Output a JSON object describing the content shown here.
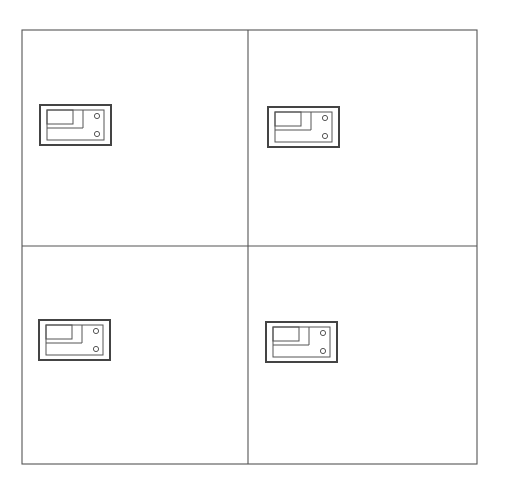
{
  "canvas": {
    "width": 505,
    "height": 487,
    "background": "#ffffff"
  },
  "colors": {
    "line": "#555555",
    "device_border": "#444444"
  },
  "frame": {
    "outer": {
      "x": 22,
      "y": 30,
      "width": 455,
      "height": 434
    },
    "divider_vertical_x": 248,
    "divider_horizontal_y": 246
  },
  "panels": [
    {
      "id": "top-left",
      "device": {
        "x": 40,
        "y": 105
      }
    },
    {
      "id": "top-right",
      "device": {
        "x": 268,
        "y": 107
      }
    },
    {
      "id": "bottom-left",
      "device": {
        "x": 39,
        "y": 320
      }
    },
    {
      "id": "bottom-right",
      "device": {
        "x": 266,
        "y": 322
      }
    }
  ],
  "device_symbol": {
    "icon": "device-plate-icon",
    "outer": {
      "w": 71,
      "h": 40
    },
    "inner": {
      "dx": 7,
      "dy": 5,
      "w": 57,
      "h": 30
    },
    "small_box": {
      "dx": 7,
      "dy": 5,
      "w": 26,
      "h": 14
    },
    "l_line": {
      "x": 43,
      "top": 5,
      "bottom": 23,
      "left": 7
    },
    "holes": [
      {
        "dx": 57,
        "dy": 11,
        "r": 2.6
      },
      {
        "dx": 57,
        "dy": 29,
        "r": 2.6
      }
    ]
  }
}
